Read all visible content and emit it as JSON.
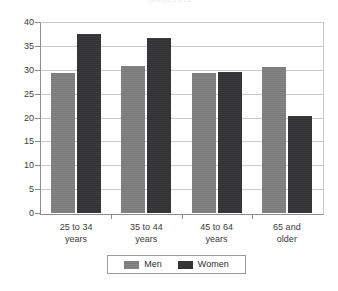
{
  "chart_data": {
    "type": "bar",
    "title": "Group, 2011",
    "categories": [
      "25 to 34 years",
      "35 to 44 years",
      "45 to 64 years",
      "65 and older"
    ],
    "category_lines": [
      [
        "25 to 34",
        "years"
      ],
      [
        "35 to 44",
        "years"
      ],
      [
        "45 to 64",
        "years"
      ],
      [
        "65 and",
        "older"
      ]
    ],
    "series": [
      {
        "name": "Men",
        "color": "#7e7e7e",
        "values": [
          29.4,
          30.8,
          29.4,
          30.6
        ]
      },
      {
        "name": "Women",
        "color": "#333335",
        "values": [
          37.5,
          36.6,
          29.6,
          20.3
        ]
      }
    ],
    "xlabel": "",
    "ylabel": "",
    "ylim": [
      0,
      40
    ],
    "y_ticks": [
      0,
      5,
      10,
      15,
      20,
      25,
      30,
      35,
      40
    ],
    "y_tick_labels": [
      "0",
      "5",
      "10",
      "15",
      "20",
      "25",
      "30",
      "35",
      "40"
    ],
    "grid": true,
    "legend_position": "bottom-center"
  },
  "colors": {
    "men": "#7e7e7e",
    "women": "#333335",
    "grid": "#c9c9c9",
    "axis": "#8c8c8c",
    "text": "#3b3b3b",
    "background": "#ffffff"
  }
}
